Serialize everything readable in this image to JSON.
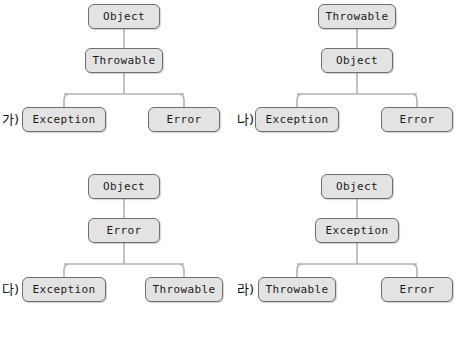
{
  "diagram": {
    "background_color": "#ffffff",
    "node_fill": "#e3e3e3",
    "node_border": "#6e6e6e",
    "connector_color": "#b4b4b4",
    "text_color": "#1a1a1a"
  },
  "options": [
    {
      "id": "ga",
      "label": "가)",
      "root": "Object",
      "mid": "Throwable",
      "leaf_left": "Exception",
      "leaf_right": "Error"
    },
    {
      "id": "na",
      "label": "나)",
      "root": "Throwable",
      "mid": "Object",
      "leaf_left": "Exception",
      "leaf_right": "Error"
    },
    {
      "id": "da",
      "label": "다)",
      "root": "Object",
      "mid": "Error",
      "leaf_left": "Exception",
      "leaf_right": "Throwable"
    },
    {
      "id": "ra",
      "label": "라)",
      "root": "Object",
      "mid": "Exception",
      "leaf_left": "Throwable",
      "leaf_right": "Error"
    }
  ]
}
